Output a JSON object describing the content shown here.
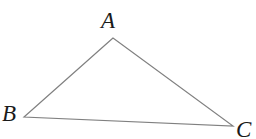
{
  "figure": {
    "name": "triangle-abc",
    "type": "geometry-diagram",
    "width": 256,
    "height": 139,
    "background_color": "#ffffff",
    "stroke_color": "#808080",
    "stroke_width": 1.2,
    "label_color": "#1a1a1a",
    "vertices": [
      {
        "id": "A",
        "label": "A",
        "x": 113,
        "y": 38
      },
      {
        "id": "B",
        "label": "B",
        "x": 24,
        "y": 117
      },
      {
        "id": "C",
        "label": "C",
        "x": 233,
        "y": 126
      }
    ],
    "edges": [
      {
        "id": "AB",
        "from": "A",
        "to": "B"
      },
      {
        "id": "BC",
        "from": "B",
        "to": "C"
      },
      {
        "id": "CA",
        "from": "C",
        "to": "A"
      }
    ],
    "labels": {
      "A": "A",
      "B": "B",
      "C": "C"
    },
    "polygon_points": "113,38 24,117 233,126"
  }
}
